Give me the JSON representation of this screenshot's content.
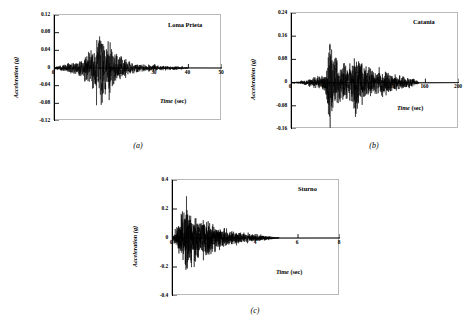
{
  "figure": {
    "ylabel": "Acceleration (g)",
    "xlabel_italic": "Time",
    "xlabel_unit": " (sec)"
  },
  "chart_data": [
    {
      "type": "line",
      "key": "a",
      "title": "Loma Prieta",
      "caption": "(a)",
      "xlabel": "Time (sec)",
      "ylabel": "Acceleration (g)",
      "xlim": [
        0,
        50
      ],
      "ylim": [
        -0.12,
        0.12
      ],
      "xticks": [
        0,
        10,
        20,
        30,
        40,
        50
      ],
      "xticklabels": [
        "0",
        "",
        "20",
        "30",
        "40",
        "50"
      ],
      "yticks": [
        0.12,
        0.08,
        0.04,
        0,
        -0.04,
        -0.08,
        -0.12
      ],
      "yticklabels": [
        "0.12",
        "0.08",
        "0.04",
        "0",
        "-0.04",
        "-0.08",
        "-0.12"
      ],
      "grid": false,
      "legend": "none",
      "peak_positive": 0.075,
      "peak_negative": -0.115,
      "peak_time": 14.2,
      "duration": 40,
      "seed": 17,
      "envelope": [
        [
          0.0,
          0.004
        ],
        [
          1.5,
          0.006
        ],
        [
          3.0,
          0.01
        ],
        [
          5.0,
          0.014
        ],
        [
          7.0,
          0.018
        ],
        [
          9.0,
          0.026
        ],
        [
          10.5,
          0.04
        ],
        [
          11.5,
          0.055
        ],
        [
          12.5,
          0.07
        ],
        [
          13.5,
          0.09
        ],
        [
          14.2,
          0.115
        ],
        [
          15.0,
          0.085
        ],
        [
          16.0,
          0.07
        ],
        [
          17.0,
          0.055
        ],
        [
          18.5,
          0.042
        ],
        [
          20.0,
          0.03
        ],
        [
          22.0,
          0.02
        ],
        [
          24.0,
          0.014
        ],
        [
          26.0,
          0.01
        ],
        [
          29.0,
          0.008
        ],
        [
          32.0,
          0.006
        ],
        [
          35.0,
          0.005
        ],
        [
          38.0,
          0.004
        ],
        [
          40.0,
          0.002
        ]
      ],
      "n_points": 1400,
      "osc_freq": 2.6
    },
    {
      "type": "line",
      "key": "b",
      "title": "Catania",
      "caption": "(b)",
      "xlabel": "Time (sec)",
      "ylabel": "Acceleration (g)",
      "xlim": [
        0,
        200
      ],
      "ylim": [
        -0.16,
        0.24
      ],
      "xticks": [
        0,
        40,
        80,
        120,
        160,
        200
      ],
      "xticklabels": [
        "0",
        "40",
        "",
        "120",
        "160",
        "200"
      ],
      "yticks": [
        0.24,
        0.16,
        0.08,
        0,
        -0.08,
        -0.16
      ],
      "yticklabels": [
        "0.24",
        "0.16",
        "0.08",
        "0",
        "-0.08",
        "-0.16"
      ],
      "grid": false,
      "legend": "none",
      "peak_positive": 0.222,
      "peak_negative": -0.16,
      "peak_time": 46,
      "duration": 152,
      "seed": 43,
      "envelope": [
        [
          0.0,
          0.002
        ],
        [
          8.0,
          0.004
        ],
        [
          16.0,
          0.01
        ],
        [
          24.0,
          0.016
        ],
        [
          30.0,
          0.02
        ],
        [
          36.0,
          0.024
        ],
        [
          40.0,
          0.034
        ],
        [
          43.0,
          0.07
        ],
        [
          46.0,
          0.222
        ],
        [
          48.0,
          0.11
        ],
        [
          52.0,
          0.12
        ],
        [
          56.0,
          0.085
        ],
        [
          60.0,
          0.075
        ],
        [
          64.0,
          0.07
        ],
        [
          68.0,
          0.09
        ],
        [
          72.0,
          0.075
        ],
        [
          76.0,
          0.16
        ],
        [
          80.0,
          0.095
        ],
        [
          84.0,
          0.08
        ],
        [
          88.0,
          0.07
        ],
        [
          92.0,
          0.06
        ],
        [
          96.0,
          0.055
        ],
        [
          100.0,
          0.05
        ],
        [
          106.0,
          0.055
        ],
        [
          112.0,
          0.045
        ],
        [
          118.0,
          0.038
        ],
        [
          124.0,
          0.032
        ],
        [
          130.0,
          0.028
        ],
        [
          136.0,
          0.024
        ],
        [
          142.0,
          0.018
        ],
        [
          148.0,
          0.012
        ],
        [
          152.0,
          0.006
        ]
      ],
      "n_points": 1500,
      "osc_freq": 0.62
    },
    {
      "type": "line",
      "key": "c",
      "title": "Sturno",
      "caption": "(c)",
      "xlabel": "Time (sec)",
      "ylabel": "Acceleration (g)",
      "xlim": [
        0,
        8
      ],
      "ylim": [
        -0.4,
        0.4
      ],
      "xticks": [
        0,
        2,
        4,
        6,
        8
      ],
      "xticklabels": [
        "0",
        "2",
        "4",
        "6",
        "8"
      ],
      "yticks": [
        0.4,
        0.2,
        0,
        -0.2,
        -0.4
      ],
      "yticklabels": [
        "0.4",
        "0.2",
        "0",
        "-0.2",
        "-0.4"
      ],
      "grid": false,
      "legend": "none",
      "peak_positive": 0.31,
      "peak_negative": -0.285,
      "peak_time": 0.72,
      "duration": 5.1,
      "seed": 91,
      "envelope": [
        [
          0.0,
          0.01
        ],
        [
          0.15,
          0.06
        ],
        [
          0.3,
          0.13
        ],
        [
          0.45,
          0.19
        ],
        [
          0.6,
          0.25
        ],
        [
          0.72,
          0.31
        ],
        [
          0.85,
          0.23
        ],
        [
          1.0,
          0.18
        ],
        [
          1.15,
          0.205
        ],
        [
          1.3,
          0.15
        ],
        [
          1.45,
          0.175
        ],
        [
          1.6,
          0.14
        ],
        [
          1.75,
          0.165
        ],
        [
          1.9,
          0.12
        ],
        [
          2.1,
          0.1
        ],
        [
          2.3,
          0.085
        ],
        [
          2.5,
          0.075
        ],
        [
          2.7,
          0.062
        ],
        [
          2.9,
          0.055
        ],
        [
          3.1,
          0.048
        ],
        [
          3.3,
          0.042
        ],
        [
          3.5,
          0.038
        ],
        [
          3.7,
          0.034
        ],
        [
          3.9,
          0.03
        ],
        [
          4.1,
          0.026
        ],
        [
          4.3,
          0.022
        ],
        [
          4.5,
          0.018
        ],
        [
          4.7,
          0.013
        ],
        [
          4.9,
          0.009
        ],
        [
          5.1,
          0.004
        ]
      ],
      "n_points": 1500,
      "osc_freq": 16.0
    }
  ]
}
